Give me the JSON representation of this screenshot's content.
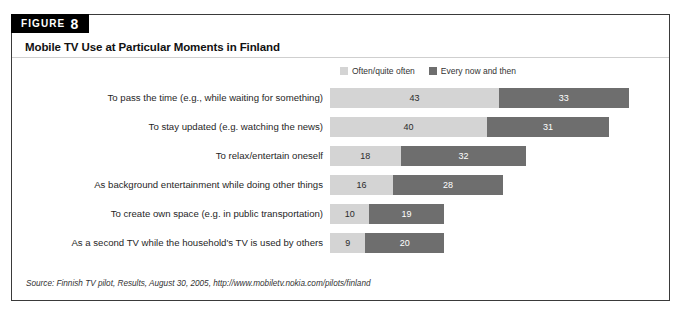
{
  "figure": {
    "badge_word": "FIGURE",
    "badge_number": "8",
    "title": "Mobile TV Use at Particular Moments in Finland",
    "source": "Source: Finnish TV pilot, Results, August 30, 2005, http://www.mobiletv.nokia.com/pilots/finland"
  },
  "colors": {
    "series_a": "#d4d4d4",
    "series_b": "#6e6e6e",
    "badge_bg": "#000000",
    "frame_border": "#3a3a3a"
  },
  "chart_data": {
    "type": "bar",
    "orientation": "horizontal",
    "stacked": true,
    "title": "Mobile TV Use at Particular Moments in Finland",
    "xlabel": "",
    "ylabel": "",
    "grid": false,
    "legend_position": "top-right",
    "xlim": [
      0,
      80
    ],
    "categories": [
      "To pass the time (e.g., while waiting for something)",
      "To stay updated (e.g. watching the news)",
      "To relax/entertain oneself",
      "As background entertainment while doing other things",
      "To create own space (e.g. in public transportation)",
      "As a second TV while the household's TV is used by others"
    ],
    "series": [
      {
        "name": "Often/quite often",
        "color": "#d4d4d4",
        "values": [
          43,
          40,
          18,
          16,
          10,
          9
        ]
      },
      {
        "name": "Every now and then",
        "color": "#6e6e6e",
        "values": [
          33,
          31,
          32,
          28,
          19,
          20
        ]
      }
    ],
    "totals": [
      76,
      71,
      50,
      44,
      29,
      29
    ]
  }
}
